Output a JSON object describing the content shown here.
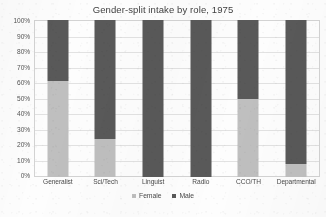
{
  "chart_data": {
    "type": "bar",
    "subtype": "100% stacked column",
    "title": "Gender-split intake by role, 1975",
    "xlabel": "",
    "ylabel": "",
    "ylim": [
      0,
      100
    ],
    "ytick_labels": [
      "100%",
      "90%",
      "80%",
      "70%",
      "60%",
      "50%",
      "40%",
      "30%",
      "20%",
      "10%",
      "0%"
    ],
    "ytick_values": [
      100,
      90,
      80,
      70,
      60,
      50,
      40,
      30,
      20,
      10,
      0
    ],
    "grid": true,
    "legend_position": "bottom-center",
    "categories": [
      "Generalist",
      "Sci/Tech",
      "Linguist",
      "Radio",
      "CCO/TH",
      "Departmental"
    ],
    "series": [
      {
        "name": "Female",
        "color": "#bfbfbf",
        "values": [
          61,
          24,
          0,
          0,
          50,
          8
        ]
      },
      {
        "name": "Male",
        "color": "#595959",
        "values": [
          39,
          76,
          100,
          100,
          50,
          92
        ]
      }
    ],
    "units": "percent",
    "annotations": []
  },
  "legend": {
    "items": [
      {
        "label": "Female",
        "color": "#bfbfbf"
      },
      {
        "label": "Male",
        "color": "#595959"
      }
    ]
  },
  "colors": {
    "female": "#bfbfbf",
    "male": "#595959",
    "gridline": "#e2e2e2",
    "frame": "#d3d3d3",
    "text": "#4a4a4a",
    "title": "#3f3f3f",
    "background": "#fdfdfd"
  }
}
